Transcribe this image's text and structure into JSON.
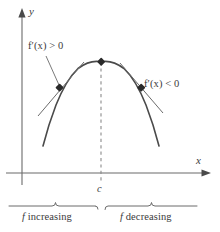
{
  "figure": {
    "type": "calculus-diagram",
    "axes": {
      "y_axis_label": "y",
      "x_axis_label": "x"
    },
    "annotations": {
      "derivative_positive": "f′(x) > 0",
      "derivative_negative": "f′(x) < 0",
      "critical_point": "c",
      "left_region": "f increasing",
      "right_region": "f decreasing"
    },
    "colors": {
      "curve": "#4a4a4a",
      "axis": "#6b6b6b",
      "tangent": "#6b6b6b",
      "dashed": "#8a8a8a",
      "brace": "#6b6b6b",
      "text": "#3a3a3a",
      "point": "#2a2a2a",
      "background": "#ffffff"
    }
  },
  "chart_data": {
    "type": "line",
    "title": "",
    "xlabel": "x",
    "ylabel": "y",
    "grid": false,
    "legend": null,
    "curve": {
      "name": "f(x)",
      "shape": "downward parabola",
      "vertex": {
        "x": "c",
        "y": "maximum"
      },
      "x_pixel_range": [
        43,
        159
      ],
      "vertex_pixel": [
        101,
        62
      ]
    },
    "points": [
      {
        "name": "left tangent point",
        "label": "f′(x) > 0",
        "slope_sign": "positive",
        "pixel": [
          60,
          88
        ]
      },
      {
        "name": "maximum point",
        "label": "c",
        "slope_sign": "zero",
        "pixel": [
          101,
          62
        ]
      },
      {
        "name": "right tangent point",
        "label": "f′(x) < 0",
        "slope_sign": "negative",
        "pixel": [
          141,
          88
        ]
      }
    ],
    "regions": [
      {
        "label": "f increasing",
        "interval": "(-∞, c)",
        "derivative": "f′(x) > 0"
      },
      {
        "label": "f decreasing",
        "interval": "(c, ∞)",
        "derivative": "f′(x) < 0"
      }
    ],
    "critical_value": "c"
  }
}
